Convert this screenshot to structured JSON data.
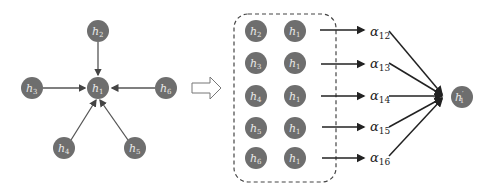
{
  "graph": {
    "center": {
      "id": "h1",
      "base": "h",
      "sub": "1"
    },
    "neighbors": [
      {
        "id": "h2",
        "base": "h",
        "sub": "2"
      },
      {
        "id": "h3",
        "base": "h",
        "sub": "3"
      },
      {
        "id": "h4",
        "base": "h",
        "sub": "4"
      },
      {
        "id": "h5",
        "base": "h",
        "sub": "5"
      },
      {
        "id": "h6",
        "base": "h",
        "sub": "6"
      }
    ]
  },
  "pairs": [
    {
      "left": {
        "base": "h",
        "sub": "2"
      },
      "right": {
        "base": "h",
        "sub": "1"
      },
      "alpha": {
        "base": "α",
        "sub": "12"
      }
    },
    {
      "left": {
        "base": "h",
        "sub": "3"
      },
      "right": {
        "base": "h",
        "sub": "1"
      },
      "alpha": {
        "base": "α",
        "sub": "13"
      }
    },
    {
      "left": {
        "base": "h",
        "sub": "4"
      },
      "right": {
        "base": "h",
        "sub": "1"
      },
      "alpha": {
        "base": "α",
        "sub": "14"
      }
    },
    {
      "left": {
        "base": "h",
        "sub": "5"
      },
      "right": {
        "base": "h",
        "sub": "1"
      },
      "alpha": {
        "base": "α",
        "sub": "15"
      }
    },
    {
      "left": {
        "base": "h",
        "sub": "6"
      },
      "right": {
        "base": "h",
        "sub": "1"
      },
      "alpha": {
        "base": "α",
        "sub": "16"
      }
    }
  ],
  "output": {
    "base": "h",
    "prime": "′",
    "sub": "1"
  },
  "colors": {
    "node": "#6e6e6e",
    "node_text": "#e8e8e8",
    "edge": "#555555",
    "arrow": "#222222"
  }
}
